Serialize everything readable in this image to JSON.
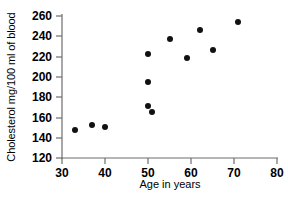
{
  "chart_data": {
    "type": "scatter",
    "title": "",
    "xlabel": "Age in years",
    "ylabel": "Cholesterol mg/100 ml of blood",
    "xlim": [
      30,
      80
    ],
    "ylim": [
      120,
      260
    ],
    "xticks": [
      30,
      40,
      50,
      60,
      70,
      80
    ],
    "yticks": [
      120,
      140,
      160,
      180,
      200,
      220,
      240,
      260
    ],
    "grid": false,
    "legend": null,
    "marker": "filled-circle",
    "marker_color": "#111111",
    "points": [
      {
        "x": 33,
        "y": 148
      },
      {
        "x": 37,
        "y": 153
      },
      {
        "x": 40,
        "y": 151
      },
      {
        "x": 50,
        "y": 223
      },
      {
        "x": 50,
        "y": 195
      },
      {
        "x": 50,
        "y": 171
      },
      {
        "x": 51,
        "y": 165
      },
      {
        "x": 55,
        "y": 237
      },
      {
        "x": 59,
        "y": 219
      },
      {
        "x": 62,
        "y": 246
      },
      {
        "x": 65,
        "y": 226
      },
      {
        "x": 71,
        "y": 254
      }
    ]
  },
  "axes": {
    "x_tick_labels": [
      "30",
      "40",
      "50",
      "60",
      "70",
      "80"
    ],
    "y_tick_labels": [
      "120",
      "140",
      "160",
      "180",
      "200",
      "220",
      "240",
      "260"
    ],
    "x_axis_title": "Age in years",
    "y_axis_title": "Cholesterol mg/100 ml of blood"
  },
  "colors": {
    "marker": "#111111",
    "axis": "#6d6d6d",
    "background": "#ffffff"
  }
}
